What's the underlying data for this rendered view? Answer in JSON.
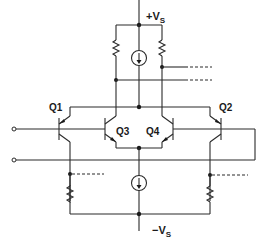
{
  "diagram": {
    "type": "circuit-schematic",
    "labels": {
      "supply_positive": "+V",
      "supply_positive_sub": "S",
      "supply_negative": "−V",
      "supply_negative_sub": "S",
      "q1": "Q1",
      "q2": "Q2",
      "q3": "Q3",
      "q4": "Q4"
    },
    "components": [
      {
        "id": "Q1",
        "kind": "pnp-transistor"
      },
      {
        "id": "Q2",
        "kind": "pnp-transistor"
      },
      {
        "id": "Q3",
        "kind": "npn-transistor"
      },
      {
        "id": "Q4",
        "kind": "npn-transistor"
      },
      {
        "id": "I_top",
        "kind": "current-source"
      },
      {
        "id": "I_bottom",
        "kind": "current-source"
      },
      {
        "id": "R_top_left",
        "kind": "resistor"
      },
      {
        "id": "R_top_right",
        "kind": "resistor"
      },
      {
        "id": "R_bottom_left",
        "kind": "resistor"
      },
      {
        "id": "R_bottom_right",
        "kind": "resistor"
      }
    ],
    "terminals": [
      "input-top",
      "input-bottom"
    ],
    "colors": {
      "line": "#2a2a2a",
      "background": "#ffffff"
    }
  }
}
